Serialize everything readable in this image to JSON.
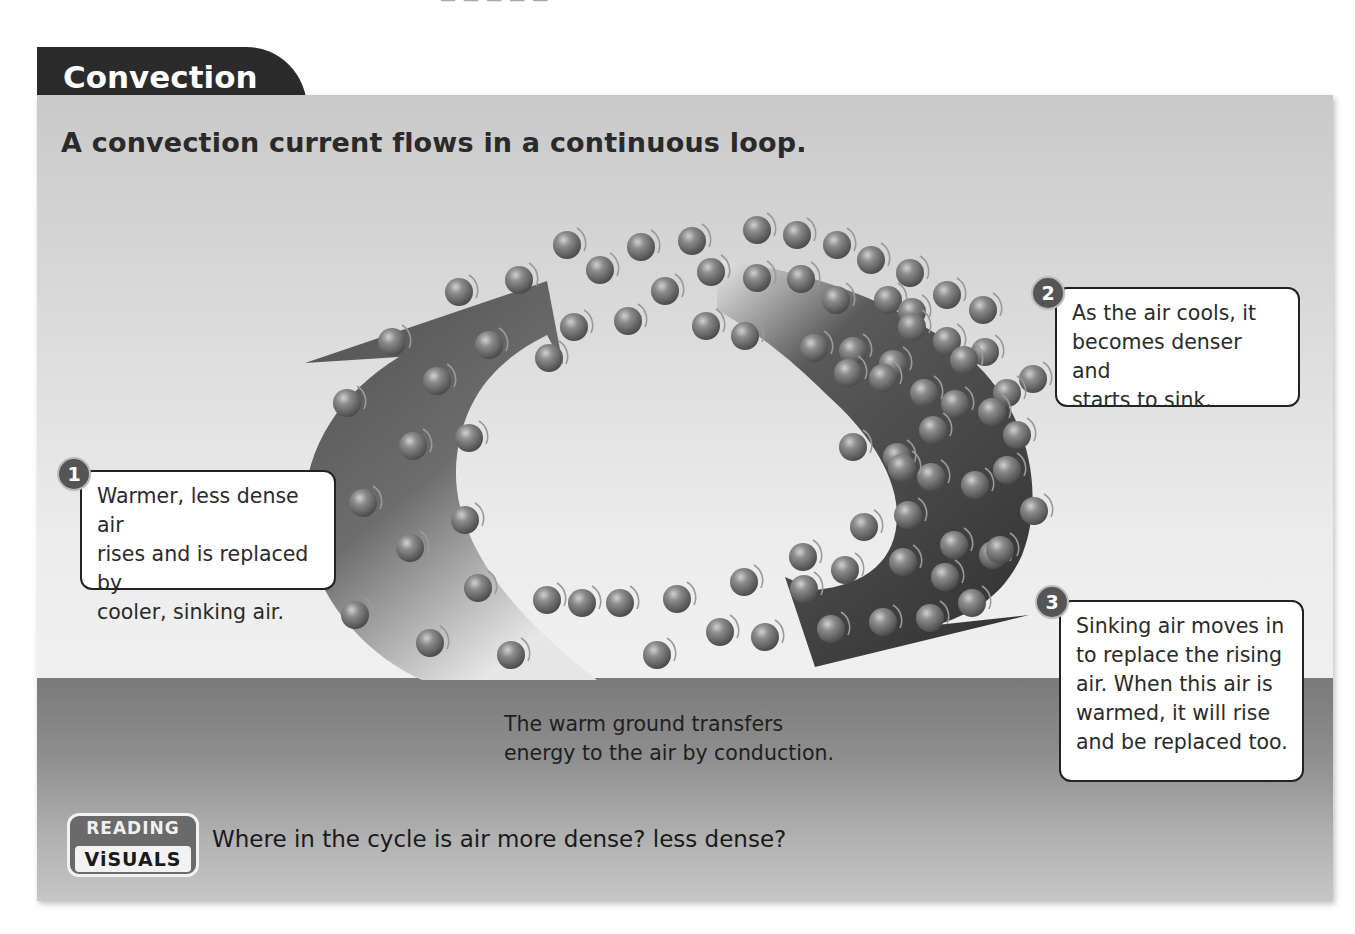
{
  "tab": {
    "title": "Convection"
  },
  "headline": "A convection current flows in a continuous loop.",
  "callouts": [
    {
      "number": "1",
      "lines": [
        "Warmer, less dense air",
        "rises and is replaced by",
        "cooler, sinking air."
      ]
    },
    {
      "number": "2",
      "lines": [
        "As the air cools, it",
        "becomes denser and",
        "starts to sink."
      ]
    },
    {
      "number": "3",
      "lines": [
        "Sinking air moves in",
        "to replace the rising",
        "air. When this air is",
        "warmed, it will rise",
        "and be replaced too."
      ]
    }
  ],
  "ground_caption": {
    "lines": [
      "The warm ground transfers",
      "energy to the air by conduction."
    ]
  },
  "reading_visuals": {
    "badge_top": "READING",
    "badge_bottom": "ViSUALS",
    "question": "Where in the cycle is air more dense? less dense?"
  },
  "icons": {
    "left_arrow": "curved-up-arrow",
    "right_arrow": "curved-down-arrow",
    "particles": "air-molecule-sphere"
  },
  "colors": {
    "tab_bg": "#2b2b2b",
    "panel_top": "#c9c9c9",
    "panel_mid": "#f0f0f0",
    "ground": "#7a7a7a",
    "arrow_left": "#6e6e6e",
    "arrow_right": "#3c3c3c",
    "particle": "#7b7b7b"
  }
}
